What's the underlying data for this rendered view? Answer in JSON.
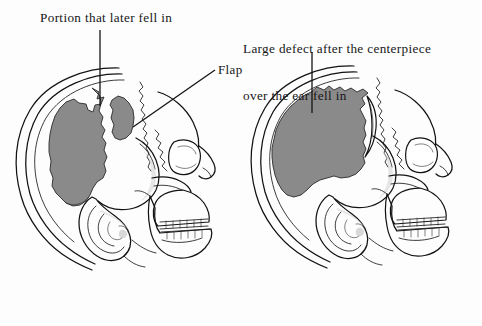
{
  "figure": {
    "background_color": "#fdfdfd",
    "ink_color": "#121212",
    "defect_gray": "#8a8a8a"
  },
  "captions": {
    "left": "Portion that later fell in",
    "right_line1": "Large defect after the centerpiece",
    "right_line2": "over the ear fell in",
    "flap": "Flap"
  },
  "panels": [
    {
      "id": "left-skull",
      "name": "skull-lateral-view-before",
      "description": "Lateral view of skull with large parietal defect and separate bone flap",
      "regions": [
        {
          "name": "large-defect-region",
          "fill": "#8a8a8a",
          "label_ref": "left"
        },
        {
          "name": "flap-region",
          "fill": "#8a8a8a",
          "label_ref": "flap"
        }
      ],
      "leaders": [
        {
          "name": "portion-leader",
          "type": "vertical",
          "from": [
            100,
            30
          ],
          "to": [
            100,
            106
          ]
        },
        {
          "name": "flap-leader",
          "type": "diagonal",
          "from": [
            215,
            70
          ],
          "to": [
            133,
            127
          ]
        }
      ]
    },
    {
      "id": "right-skull",
      "name": "skull-lateral-view-after",
      "description": "Lateral view of skull with enlarged merged defect after centerpiece fell in",
      "regions": [
        {
          "name": "large-defect-region",
          "fill": "#8a8a8a",
          "label_ref": "right"
        }
      ],
      "leaders": [
        {
          "name": "defect-leader",
          "type": "vertical",
          "from": [
            312,
            52
          ],
          "to": [
            312,
            113
          ]
        }
      ]
    }
  ]
}
